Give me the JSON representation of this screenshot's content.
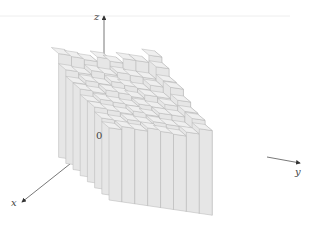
{
  "chart_data": {
    "type": "bar3d",
    "title": "",
    "axes": {
      "x_label": "x",
      "y_label": "y",
      "z_label": "z",
      "origin_label": "0"
    },
    "grid": false,
    "legend": null,
    "grid_size": {
      "x_divisions": 8,
      "y_divisions": 8
    },
    "front_row_heights_relative": [
      0.85,
      0.86,
      0.87,
      0.88,
      0.88,
      0.89,
      0.91,
      1.0
    ],
    "right_column_heights_relative": [
      1.0,
      1.03,
      1.08,
      1.12,
      1.18,
      1.23,
      1.3,
      1.42
    ],
    "colors": {
      "bar_front": "#e6e6e6",
      "bar_side": "#d9d9d9",
      "bar_top": "#efefef",
      "edge": "#b5b5b5",
      "axis": "#555555"
    }
  },
  "labels": {
    "x": "x",
    "y": "y",
    "z": "z",
    "origin": "0"
  }
}
